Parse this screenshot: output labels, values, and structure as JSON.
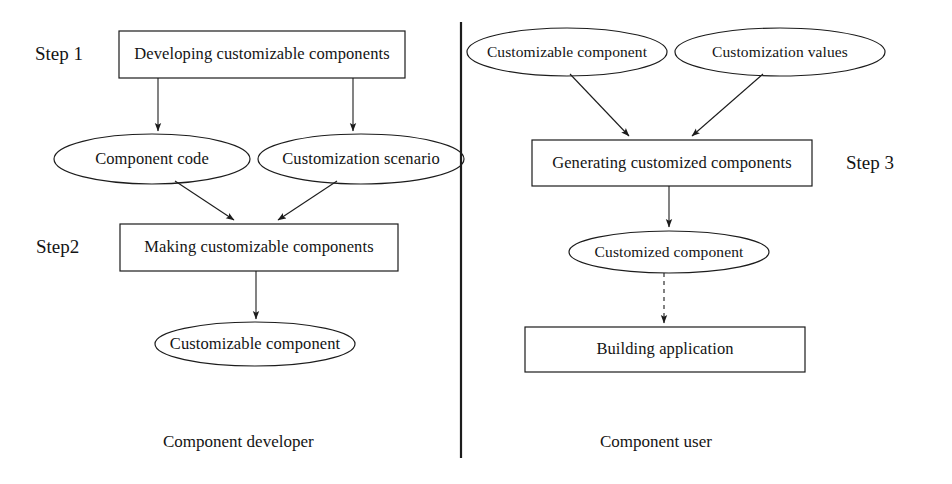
{
  "figure": {
    "divider": {
      "name": "vertical-divider",
      "x": 461,
      "y1": 22,
      "y2": 458
    },
    "stroke_color": "#1c1c1c",
    "background_color": "#ffffff"
  },
  "left_panel": {
    "role_label": "Component developer",
    "step_labels": [
      {
        "id": "step1",
        "text": "Step 1"
      },
      {
        "id": "step2",
        "text": "Step2"
      }
    ],
    "nodes": [
      {
        "id": "developing",
        "shape": "rect",
        "text": "Developing customizable components",
        "x": 119,
        "y": 31,
        "w": 286,
        "h": 47
      },
      {
        "id": "component-code",
        "shape": "ellipse",
        "text": "Component code",
        "cx": 152,
        "cy": 159,
        "rx": 98,
        "ry": 25
      },
      {
        "id": "customization-scenario",
        "shape": "ellipse",
        "text": "Customization scenario",
        "cx": 361,
        "cy": 159,
        "rx": 103,
        "ry": 25
      },
      {
        "id": "making",
        "shape": "rect",
        "text": "Making customizable components",
        "x": 120,
        "y": 224,
        "w": 278,
        "h": 47
      },
      {
        "id": "customizable-component-left",
        "shape": "ellipse",
        "text": "Customizable component",
        "cx": 255,
        "cy": 344,
        "rx": 100,
        "ry": 22
      }
    ],
    "edges": [
      {
        "from": "developing",
        "to": "component-code",
        "style": "solid"
      },
      {
        "from": "developing",
        "to": "customization-scenario",
        "style": "solid"
      },
      {
        "from": "component-code",
        "to": "making",
        "style": "solid"
      },
      {
        "from": "customization-scenario",
        "to": "making",
        "style": "solid"
      },
      {
        "from": "making",
        "to": "customizable-component-left",
        "style": "solid"
      }
    ]
  },
  "right_panel": {
    "role_label": "Component user",
    "step_labels": [
      {
        "id": "step3",
        "text": "Step 3"
      }
    ],
    "nodes": [
      {
        "id": "customizable-component-right",
        "shape": "ellipse",
        "text": "Customizable component",
        "cx": 567,
        "cy": 52,
        "rx": 100,
        "ry": 24
      },
      {
        "id": "customization-values",
        "shape": "ellipse",
        "text": "Customization values",
        "cx": 780,
        "cy": 52,
        "rx": 105,
        "ry": 24
      },
      {
        "id": "generating",
        "shape": "rect",
        "text": "Generating customized components",
        "x": 532,
        "y": 140,
        "w": 280,
        "h": 46
      },
      {
        "id": "customized-component",
        "shape": "ellipse",
        "text": "Customized component",
        "cx": 669,
        "cy": 252,
        "rx": 100,
        "ry": 21
      },
      {
        "id": "building-application",
        "shape": "rect",
        "text": "Building application",
        "x": 525,
        "y": 327,
        "w": 280,
        "h": 45
      }
    ],
    "edges": [
      {
        "from": "customizable-component-right",
        "to": "generating",
        "style": "solid"
      },
      {
        "from": "customization-values",
        "to": "generating",
        "style": "solid"
      },
      {
        "from": "generating",
        "to": "customized-component",
        "style": "solid"
      },
      {
        "from": "customized-component",
        "to": "building-application",
        "style": "dashed"
      }
    ]
  }
}
